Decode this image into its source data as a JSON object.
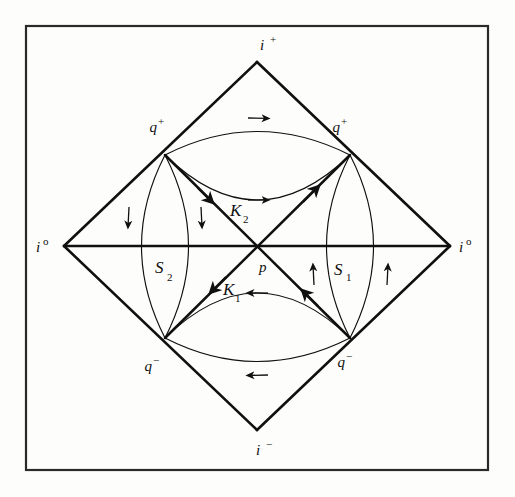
{
  "figure": {
    "background_color": "#fdfdfb",
    "ink_color": "#101010",
    "frame": {
      "name": "outer-border",
      "x": 26,
      "y": 26,
      "width": 462,
      "height": 444,
      "stroke_color": "#2a2a2a",
      "stroke_width": 2.2
    }
  },
  "labels": {
    "top_vertex": {
      "base": "i",
      "script": "+"
    },
    "bottom_vertex": {
      "base": "i",
      "script": "−"
    },
    "left_vertex": {
      "base": "i",
      "script": "o"
    },
    "right_vertex": {
      "base": "i",
      "script": "o"
    },
    "upper_left_node": {
      "base": "q",
      "script": "+"
    },
    "upper_right_node": {
      "base": "q",
      "script": "+"
    },
    "lower_left_node": {
      "base": "q",
      "script": "−"
    },
    "lower_right_node": {
      "base": "q",
      "script": "−"
    },
    "center_point": {
      "base": "p",
      "script": ""
    },
    "region_right": {
      "base": "S",
      "script": "1"
    },
    "region_left": {
      "base": "S",
      "script": "2"
    },
    "null_upper": {
      "base": "K",
      "script": "2"
    },
    "null_lower": {
      "base": "K",
      "script": "1"
    }
  },
  "geometry": {
    "diamond": {
      "name": "conformal-diamond",
      "top": [
        257,
        62
      ],
      "right": [
        450,
        246
      ],
      "bottom": [
        257,
        430
      ],
      "left": [
        64,
        246
      ],
      "stroke_width": 2.4
    },
    "nodes": {
      "upper_left": [
        165,
        155
      ],
      "upper_right": [
        350,
        155
      ],
      "lower_left": [
        165,
        338
      ],
      "lower_right": [
        350,
        338
      ],
      "center": [
        257,
        246
      ]
    },
    "horizontal_axis": {
      "from": [
        64,
        246
      ],
      "to": [
        450,
        246
      ]
    },
    "null_lines": {
      "k2": {
        "from": [
          165,
          155
        ],
        "to": [
          350,
          338
        ]
      },
      "k1": {
        "from": [
          350,
          155
        ],
        "to": [
          165,
          338
        ]
      }
    }
  },
  "curves": {
    "upper_lens": {
      "name": "upper-lens",
      "direction": "rightward",
      "arc_top_bulge": -42,
      "arc_bottom_bulge": 6
    },
    "lower_lens": {
      "name": "lower-lens",
      "direction": "leftward",
      "arc_top_bulge": -6,
      "arc_bottom_bulge": 42
    },
    "left_lens": {
      "name": "left-lens",
      "direction": "downward"
    },
    "right_lens": {
      "name": "right-lens",
      "direction": "upward"
    }
  }
}
